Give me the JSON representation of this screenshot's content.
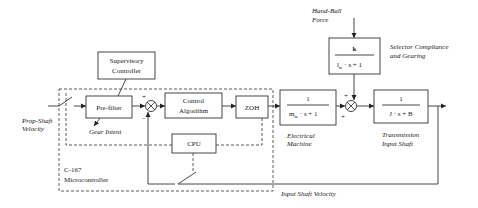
{
  "diagram": {
    "blocks": {
      "supervisory": {
        "line1": "Supervisory",
        "line2": "Controller"
      },
      "prefilter": {
        "label": "Pre-filter"
      },
      "control": {
        "line1": "Control",
        "line2": "Algorithm"
      },
      "zoh": {
        "label": "ZOH"
      },
      "cpu": {
        "label": "CPU"
      },
      "electrical": {
        "num": "1",
        "den_a": "m",
        "den_sub": "tc",
        "den_b": " · s + 1"
      },
      "selector": {
        "num": "k",
        "den_a": "l",
        "den_sub": "tc",
        "den_b": " · s + 1"
      },
      "transmission": {
        "num": "1",
        "den": "J · s + B"
      }
    },
    "labels": {
      "prop_shaft_1": "Prop-Shaft",
      "prop_shaft_2": "Velocity",
      "gear_intent": "Gear Intent",
      "micro_1": "C-167",
      "micro_2": "Microcontroller",
      "hand_ball_1": "Hand-Ball",
      "hand_ball_2": "Force",
      "selector_1": "Selector Compliance",
      "selector_2": "and Gearing",
      "electrical_1": "Electrical",
      "electrical_2": "Machine",
      "transmission_1": "Transmission",
      "transmission_2": "Input Shaft",
      "input_shaft_velocity": "Input Shaft Velocity"
    },
    "signs": {
      "sum1_plus": "+",
      "sum1_minus": "−",
      "sum2_plus_top": "+",
      "sum2_plus_left": "+"
    }
  }
}
